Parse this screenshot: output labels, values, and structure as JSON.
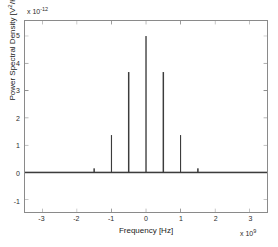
{
  "chart_data": {
    "type": "bar",
    "title": "",
    "subtitle": "",
    "xlabel": "Frequency [Hz]",
    "ylabel": "Power Spectral Density [V2/Hz]",
    "ylabel_base": "Power Spectral Density [V",
    "ylabel_exponent": "2",
    "ylabel_tail": "/Hz]",
    "x_multiplier_text": "x 10",
    "x_multiplier_exponent": "9",
    "y_multiplier_text": "x 10",
    "y_multiplier_exponent": "-12",
    "x_scale_factor": 1000000000,
    "y_scale_factor": 1e-12,
    "xlim": [
      -3.5,
      3.5
    ],
    "ylim": [
      -1.45,
      5.55
    ],
    "xticks": [
      -3,
      -2,
      -1,
      0,
      1,
      2,
      3
    ],
    "xtick_labels": [
      "-3",
      "-2",
      "-1",
      "0",
      "1",
      "2",
      "3"
    ],
    "yticks": [
      -1,
      0,
      1,
      2,
      3,
      4,
      5
    ],
    "ytick_labels": [
      "-1",
      "0",
      "1",
      "2",
      "3",
      "4",
      "5"
    ],
    "grid": false,
    "legend": null,
    "series_name": "Power Spectral Density",
    "x": [
      -1.5,
      -1.0,
      -0.5,
      0.0,
      0.5,
      1.0,
      1.5
    ],
    "values": [
      0.15,
      1.37,
      3.68,
      5.0,
      3.68,
      1.37,
      0.15
    ],
    "baseline": 0,
    "line_color": "#3c3c3c",
    "axis_color": "#8a8a8a",
    "text_color": "#1a1a1a",
    "background_color": "#ffffff",
    "stem_width_px": 1.4,
    "baseline_width_px": 1.6
  },
  "figure": {
    "background_color": "#ffffff",
    "border_color": "#8a8a8a"
  }
}
